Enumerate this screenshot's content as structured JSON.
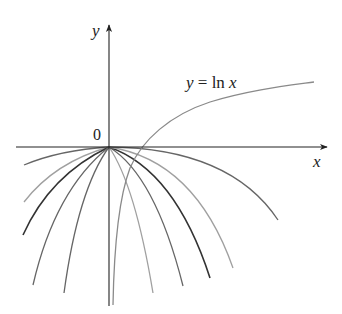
{
  "diagram": {
    "title_label": "y = ln x",
    "label_parts": {
      "y": "y",
      "eq": " = ln ",
      "x": "x"
    },
    "axis_labels": {
      "x": "x",
      "y": "y",
      "origin": "0"
    },
    "colors": {
      "axis": "#222222",
      "ln_curve": "#8a8a8a",
      "parabola_dark": "#333333",
      "parabola_mid": "#666666",
      "parabola_light": "#a0a0a0"
    },
    "curves": {
      "ln_curve": "M113,305 C114,250 118,200 130,168 C142,140 170,115 210,102 C250,90 285,86 314,82",
      "parabolas": [
        {
          "name": "left-1",
          "d": "M109,147 Q60,150 24,165",
          "shade": "mid"
        },
        {
          "name": "left-2",
          "d": "M109,147 Q55,162 24,202",
          "shade": "light"
        },
        {
          "name": "left-3",
          "d": "M109,147 Q50,175 23,235",
          "shade": "dark"
        },
        {
          "name": "left-4",
          "d": "M109,147 Q55,190 33,285",
          "shade": "mid"
        },
        {
          "name": "left-5",
          "d": "M109,147 Q78,190 64,293",
          "shade": "mid"
        },
        {
          "name": "right-1",
          "d": "M109,147 Q135,185 153,293",
          "shade": "light"
        },
        {
          "name": "right-2",
          "d": "M109,147 Q155,175 183,286",
          "shade": "mid"
        },
        {
          "name": "right-3",
          "d": "M109,147 Q175,170 210,278",
          "shade": "dark"
        },
        {
          "name": "right-4",
          "d": "M109,147 Q195,160 233,268",
          "shade": "light"
        },
        {
          "name": "right-5",
          "d": "M109,147 Q230,148 278,220",
          "shade": "mid"
        }
      ]
    }
  }
}
